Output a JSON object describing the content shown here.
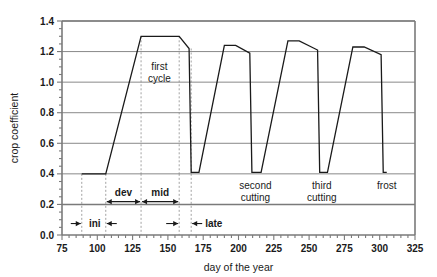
{
  "chart_data": {
    "type": "line",
    "title": "",
    "xlabel": "day of the year",
    "ylabel": "crop coefficient",
    "xlim": [
      75,
      325
    ],
    "ylim": [
      0.0,
      1.4
    ],
    "x_major_step": 25,
    "x_minor_step": 5,
    "y_major_step": 0.2,
    "y_minor_step": 0.05,
    "grid": "horizontal-major",
    "legend": "none",
    "x_tick_labels": [
      "75",
      "100",
      "125",
      "150",
      "175",
      "200",
      "225",
      "250",
      "275",
      "300",
      "325"
    ],
    "y_tick_labels": [
      "0.0",
      "0.2",
      "0.4",
      "0.6",
      "0.8",
      "1.0",
      "1.2",
      "1.4"
    ],
    "series": [
      {
        "name": "crop coefficient Kc",
        "points": [
          [
            89,
            0.4
          ],
          [
            106,
            0.4
          ],
          [
            131,
            1.3
          ],
          [
            158,
            1.3
          ],
          [
            165,
            1.22
          ],
          [
            166.5,
            0.41
          ],
          [
            172,
            0.41
          ],
          [
            190,
            1.24
          ],
          [
            198,
            1.24
          ],
          [
            208,
            1.19
          ],
          [
            209.5,
            0.41
          ],
          [
            216,
            0.41
          ],
          [
            235,
            1.27
          ],
          [
            243,
            1.27
          ],
          [
            256,
            1.21
          ],
          [
            257.5,
            0.41
          ],
          [
            263,
            0.41
          ],
          [
            281,
            1.23
          ],
          [
            289,
            1.23
          ],
          [
            301,
            1.18
          ],
          [
            302.5,
            0.41
          ],
          [
            305,
            0.41
          ]
        ]
      }
    ],
    "annotations": [
      {
        "name": "first-cycle",
        "text_line1": "first",
        "text_line2": "cycle",
        "x": 144,
        "y": 1.08
      },
      {
        "name": "second-cutting",
        "text_line1": "second",
        "text_line2": "cutting",
        "x": 212,
        "y": 0.3
      },
      {
        "name": "third-cutting",
        "text_line1": "third",
        "text_line2": "cutting",
        "x": 259,
        "y": 0.3
      },
      {
        "name": "frost",
        "text_line1": "frost",
        "text_line2": "",
        "x": 305,
        "y": 0.3
      }
    ],
    "stage_labels": [
      {
        "name": "ini",
        "label": "ini",
        "start": 89,
        "end": 106
      },
      {
        "name": "dev",
        "label": "dev",
        "start": 106,
        "end": 131
      },
      {
        "name": "mid",
        "label": "mid",
        "start": 131,
        "end": 158
      },
      {
        "name": "late",
        "label": "late",
        "start": 158,
        "end": 166.5
      }
    ],
    "stage_dividers": [
      89,
      106,
      131,
      158,
      166.5
    ],
    "colors": {
      "curve": "#1a1a1a",
      "grid": "#555555",
      "axis": "#7a7a7a",
      "dashed_divider": "#8a8a8a",
      "text": "#1a1a1a",
      "background": "#ffffff"
    }
  }
}
